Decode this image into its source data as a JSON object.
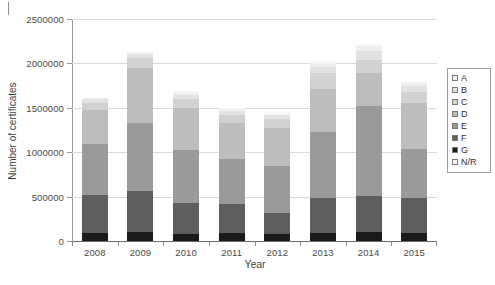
{
  "chart_data": {
    "type": "bar",
    "subtype": "stacked-bar",
    "title": "",
    "xlabel": "Year",
    "ylabel": "Number of certificates",
    "categories": [
      "2008",
      "2009",
      "2010",
      "2011",
      "2012",
      "2013",
      "2014",
      "2015"
    ],
    "ylim": [
      0,
      2500000
    ],
    "yticks": [
      0,
      500000,
      1000000,
      1500000,
      2000000,
      2500000
    ],
    "ytick_labels": [
      "0",
      "500000",
      "1000000",
      "1500000",
      "2000000",
      "2500000"
    ],
    "grid": true,
    "legend_position": "right",
    "stack_order_bottom_to_top": [
      "G",
      "F",
      "E",
      "D",
      "C",
      "B",
      "A",
      "N/R"
    ],
    "series": [
      {
        "name": "G",
        "color": "#1a1a1a",
        "values": [
          95000,
          100000,
          80000,
          85000,
          80000,
          95000,
          100000,
          90000
        ]
      },
      {
        "name": "F",
        "color": "#5e5e5e",
        "values": [
          420000,
          460000,
          350000,
          330000,
          240000,
          390000,
          410000,
          390000
        ]
      },
      {
        "name": "E",
        "color": "#9a9a9a",
        "values": [
          580000,
          770000,
          590000,
          510000,
          530000,
          740000,
          1010000,
          560000
        ]
      },
      {
        "name": "D",
        "color": "#bdbdbd",
        "values": [
          380000,
          620000,
          480000,
          400000,
          420000,
          490000,
          370000,
          510000
        ]
      },
      {
        "name": "C",
        "color": "#d2d2d2",
        "values": [
          85000,
          110000,
          100000,
          95000,
          100000,
          180000,
          150000,
          130000
        ]
      },
      {
        "name": "B",
        "color": "#e2e2e2",
        "values": [
          40000,
          45000,
          50000,
          45000,
          45000,
          70000,
          100000,
          70000
        ]
      },
      {
        "name": "A",
        "color": "#efefef",
        "values": [
          15000,
          15000,
          20000,
          20000,
          20000,
          45000,
          55000,
          30000
        ]
      },
      {
        "name": "N/R",
        "color": "#f8f8f8",
        "values": [
          10000,
          10000,
          20000,
          15000,
          15000,
          20000,
          25000,
          20000
        ]
      }
    ],
    "totals": [
      1625000,
      2130000,
      1690000,
      1500000,
      1450000,
      2030000,
      2221000,
      1800000
    ]
  },
  "legend": {
    "items": [
      {
        "label": "A",
        "color": "#efefef"
      },
      {
        "label": "B",
        "color": "#e2e2e2"
      },
      {
        "label": "C",
        "color": "#d2d2d2"
      },
      {
        "label": "D",
        "color": "#bdbdbd"
      },
      {
        "label": "E",
        "color": "#9a9a9a"
      },
      {
        "label": "F",
        "color": "#5e5e5e"
      },
      {
        "label": "G",
        "color": "#1a1a1a"
      },
      {
        "label": "N/R",
        "color": "#f8f8f8"
      }
    ]
  }
}
